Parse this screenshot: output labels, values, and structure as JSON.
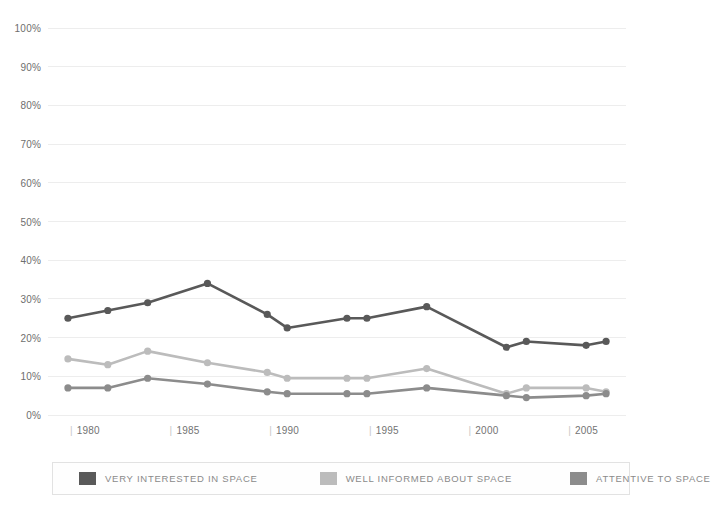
{
  "chart_data": {
    "type": "line",
    "title": "",
    "subtitle": "",
    "xlabel": "",
    "ylabel": "",
    "x": [
      1980,
      1982,
      1984,
      1987,
      1990,
      1991,
      1994,
      1995,
      1998,
      2002,
      2003,
      2006,
      2007
    ],
    "xlim": [
      1979,
      2008
    ],
    "ylim": [
      0,
      100
    ],
    "grid": true,
    "legend_position": "bottom",
    "x_tick_labels": [
      "1980",
      "1985",
      "1990",
      "1995",
      "2000",
      "2005"
    ],
    "x_tick_values": [
      1980,
      1985,
      1990,
      1995,
      2000,
      2005
    ],
    "y_tick_labels": [
      "0%",
      "10%",
      "20%",
      "30%",
      "40%",
      "50%",
      "60%",
      "70%",
      "80%",
      "90%",
      "100%"
    ],
    "y_tick_values": [
      0,
      10,
      20,
      30,
      40,
      50,
      60,
      70,
      80,
      90,
      100
    ],
    "series": [
      {
        "name": "VERY INTERESTED IN SPACE",
        "color": "#595959",
        "values": [
          25,
          27,
          29,
          34,
          26,
          22.5,
          25,
          25,
          28,
          17.5,
          19,
          18,
          19
        ]
      },
      {
        "name": "WELL INFORMED ABOUT SPACE",
        "color": "#bcbcbc",
        "values": [
          14.5,
          13,
          16.5,
          13.5,
          11,
          9.5,
          9.5,
          9.5,
          12,
          5.5,
          7,
          7,
          6
        ]
      },
      {
        "name": "ATTENTIVE TO SPACE",
        "color": "#8c8c8c",
        "values": [
          7,
          7,
          9.5,
          8,
          6,
          5.5,
          5.5,
          5.5,
          7,
          5,
          4.5,
          5,
          5.5
        ]
      }
    ]
  },
  "legend": {
    "items": [
      {
        "label": "VERY INTERESTED IN SPACE",
        "color": "#595959"
      },
      {
        "label": "WELL INFORMED ABOUT SPACE",
        "color": "#bcbcbc"
      },
      {
        "label": "ATTENTIVE TO SPACE",
        "color": "#8c8c8c"
      }
    ]
  },
  "colors": {
    "background": "#ffffff",
    "gridline": "#ededed",
    "axis_text": "#6e6e6e",
    "legend_border": "#e2e2e2"
  }
}
